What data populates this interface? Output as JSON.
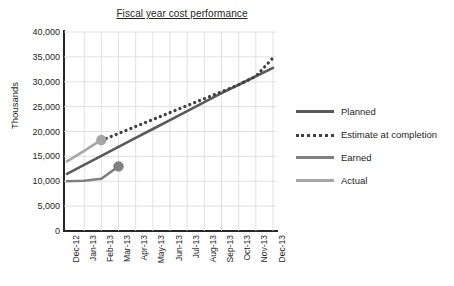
{
  "chart_data": {
    "type": "line",
    "title": "Fiscal year cost performance",
    "xlabel": "",
    "ylabel": "Thousands",
    "ylim": [
      0,
      40000
    ],
    "ytick_step": 5000,
    "yticks": [
      "0",
      "5,000",
      "10,000",
      "15,000",
      "20,000",
      "25,000",
      "30,000",
      "35,000",
      "40,000"
    ],
    "ytick_values": [
      0,
      5000,
      10000,
      15000,
      20000,
      25000,
      30000,
      35000,
      40000
    ],
    "grid": true,
    "legend_position": "right",
    "categories": [
      "Dec-12",
      "Jan-13",
      "Feb-13",
      "Mar-13",
      "Apr-13",
      "May-13",
      "Jun-13",
      "Jul-13",
      "Aug-13",
      "Sep-13",
      "Oct-13",
      "Nov-13",
      "Dec-13"
    ],
    "series": [
      {
        "name": "Planned",
        "color": "#595959",
        "style": "solid",
        "marker": "none",
        "values": [
          11500,
          13300,
          15100,
          16900,
          18700,
          20500,
          22300,
          24100,
          25900,
          27700,
          29400,
          31100,
          32800
        ]
      },
      {
        "name": "Estimate at completion",
        "color": "#404040",
        "style": "dotted",
        "marker": "none",
        "values": [
          null,
          null,
          18200,
          19600,
          21000,
          22400,
          23800,
          25200,
          26600,
          28000,
          29400,
          31100,
          34800
        ]
      },
      {
        "name": "Earned",
        "color": "#808080",
        "style": "solid",
        "marker": "circle",
        "values": [
          10000,
          10100,
          10500,
          13000,
          null,
          null,
          null,
          null,
          null,
          null,
          null,
          null,
          null
        ]
      },
      {
        "name": "Actual",
        "color": "#a6a6a6",
        "style": "solid",
        "marker": "circle",
        "values": [
          14000,
          16100,
          18300,
          null,
          null,
          null,
          null,
          null,
          null,
          null,
          null,
          null,
          null
        ]
      }
    ],
    "annotations": [
      {
        "series": "Actual",
        "category": "Feb-13",
        "value": 18300,
        "marker": "circle",
        "color": "#a6a6a6"
      },
      {
        "series": "Earned",
        "category": "Mar-13",
        "value": 13000,
        "marker": "circle",
        "color": "#808080"
      }
    ]
  },
  "legend": {
    "items": [
      {
        "label": "Planned",
        "color": "#595959",
        "style": "solid"
      },
      {
        "label": "Estimate at completion",
        "color": "#404040",
        "style": "dotted"
      },
      {
        "label": "Earned",
        "color": "#808080",
        "style": "solid"
      },
      {
        "label": "Actual",
        "color": "#a6a6a6",
        "style": "solid"
      }
    ]
  },
  "colors": {
    "axis": "#262626",
    "grid": "#d9d9d9",
    "background": "#ffffff",
    "text": "#262626"
  }
}
